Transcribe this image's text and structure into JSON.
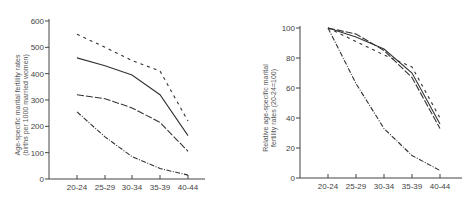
{
  "chart_data": [
    {
      "type": "line",
      "title": "",
      "xlabel": "",
      "ylabel": "Age-specific marital fertility rates (births per 1000 married women)",
      "ylabel_lines": [
        "Age-specific marital fertility rates",
        "(births per 1000 married women)"
      ],
      "categories": [
        "20-24",
        "25-29",
        "30-34",
        "35-39",
        "40-44"
      ],
      "yticks": [
        0,
        100,
        200,
        300,
        400,
        500,
        600
      ],
      "ylim": [
        0,
        600
      ],
      "grid": false,
      "legend": "none",
      "series": [
        {
          "name": "short-dash",
          "style": "short-dash",
          "values": [
            550,
            500,
            450,
            410,
            220
          ]
        },
        {
          "name": "solid",
          "style": "solid",
          "values": [
            460,
            430,
            395,
            320,
            165
          ]
        },
        {
          "name": "long-dash",
          "style": "long-dash",
          "values": [
            320,
            305,
            270,
            215,
            105
          ]
        },
        {
          "name": "dash-dot",
          "style": "dash-dot",
          "values": [
            255,
            160,
            85,
            40,
            15
          ]
        }
      ]
    },
    {
      "type": "line",
      "title": "",
      "xlabel": "",
      "ylabel": "Relative age-specific marital fertility rates (20-24=100)",
      "ylabel_lines": [
        "Relative age-specific marital",
        "fertility rates (20-24=100)"
      ],
      "categories": [
        "20-24",
        "25-29",
        "30-34",
        "35-39",
        "40-44"
      ],
      "yticks": [
        0,
        20,
        40,
        60,
        80,
        100
      ],
      "ylim": [
        0,
        100
      ],
      "grid": false,
      "legend": "none",
      "series": [
        {
          "name": "short-dash",
          "style": "short-dash",
          "values": [
            100,
            91,
            82,
            74,
            40
          ]
        },
        {
          "name": "solid",
          "style": "solid",
          "values": [
            100,
            94,
            86,
            70,
            36
          ]
        },
        {
          "name": "long-dash",
          "style": "long-dash",
          "values": [
            100,
            96,
            85,
            67,
            33
          ]
        },
        {
          "name": "dash-dot",
          "style": "dash-dot",
          "values": [
            100,
            63,
            33,
            15,
            5
          ]
        }
      ]
    }
  ]
}
